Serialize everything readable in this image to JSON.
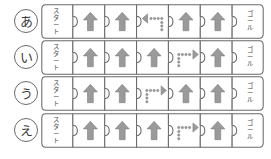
{
  "sheet": {
    "title": "Arrow puzzle worksheet",
    "rows_count": 4,
    "cells_per_row": 7,
    "colors": {
      "outline": "#6a6a6a",
      "arrow_fill": "#9a9a9a",
      "arrow_stroke": "#7d7d7d",
      "text": "#4a4a4a",
      "background": "#ffffff"
    }
  },
  "labels": {
    "start": "スタート",
    "goal": "ゴール"
  },
  "icons": {
    "arrow_up": "arrow-up-icon",
    "arrow_left_dotted": "arrow-left-dotted-icon",
    "arrow_right_dotted": "arrow-right-dotted-icon",
    "start_piece": "start-piece-icon",
    "goal_piece": "goal-piece-icon"
  },
  "rows": [
    {
      "id": "row-a",
      "label": "あ",
      "cells": [
        {
          "type": "start",
          "text": "スタート"
        },
        {
          "type": "arrow",
          "direction": "up"
        },
        {
          "type": "arrow",
          "direction": "up"
        },
        {
          "type": "arrow",
          "direction": "left-dotted"
        },
        {
          "type": "arrow",
          "direction": "up"
        },
        {
          "type": "arrow",
          "direction": "up"
        },
        {
          "type": "goal",
          "text": "ゴール"
        }
      ]
    },
    {
      "id": "row-i",
      "label": "い",
      "cells": [
        {
          "type": "start",
          "text": "スタート"
        },
        {
          "type": "arrow",
          "direction": "up"
        },
        {
          "type": "arrow",
          "direction": "up"
        },
        {
          "type": "arrow",
          "direction": "up"
        },
        {
          "type": "arrow",
          "direction": "right-dotted"
        },
        {
          "type": "arrow",
          "direction": "up"
        },
        {
          "type": "goal",
          "text": "ゴール"
        }
      ]
    },
    {
      "id": "row-u",
      "label": "う",
      "cells": [
        {
          "type": "start",
          "text": "スタート"
        },
        {
          "type": "arrow",
          "direction": "up"
        },
        {
          "type": "arrow",
          "direction": "up"
        },
        {
          "type": "arrow",
          "direction": "right-dotted"
        },
        {
          "type": "arrow",
          "direction": "up"
        },
        {
          "type": "arrow",
          "direction": "up"
        },
        {
          "type": "goal",
          "text": "ゴール"
        }
      ]
    },
    {
      "id": "row-e",
      "label": "え",
      "cells": [
        {
          "type": "start",
          "text": "スタート"
        },
        {
          "type": "arrow",
          "direction": "up"
        },
        {
          "type": "arrow",
          "direction": "up"
        },
        {
          "type": "arrow",
          "direction": "up"
        },
        {
          "type": "arrow",
          "direction": "right-dotted"
        },
        {
          "type": "arrow",
          "direction": "up"
        },
        {
          "type": "goal",
          "text": "ゴール"
        }
      ]
    }
  ]
}
